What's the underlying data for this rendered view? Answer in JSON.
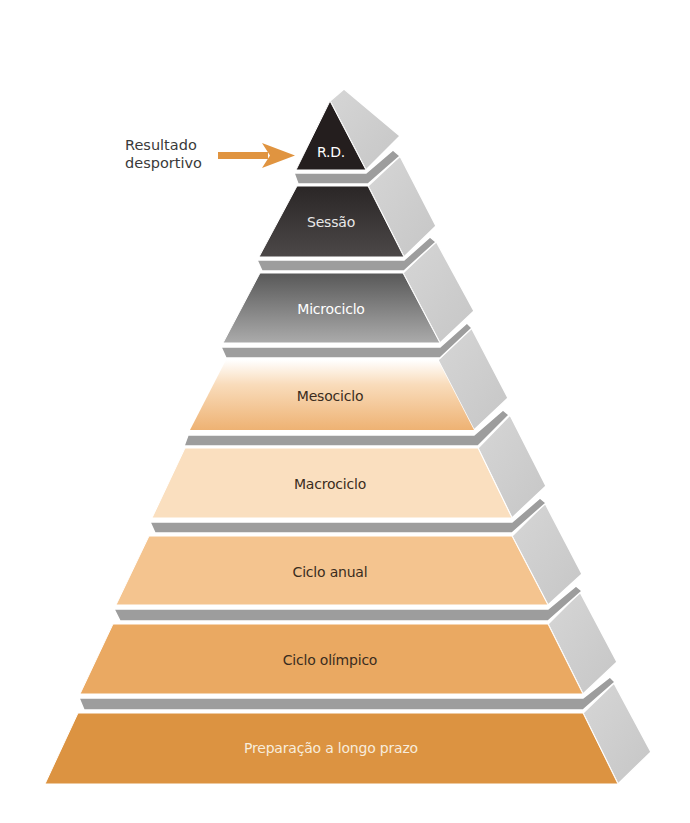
{
  "diagram": {
    "type": "pyramid",
    "callout": {
      "line1": "Resultado",
      "line2": "desportivo",
      "arrow_color": "#e09440",
      "points_to": "R.D."
    },
    "tiers": [
      {
        "label": "R.D.",
        "text_color": "#ffffff"
      },
      {
        "label": "Sessão",
        "text_color": "#e8e8e8"
      },
      {
        "label": "Microciclo",
        "text_color": "#ffffff"
      },
      {
        "label": "Mesociclo",
        "text_color": "#3a2c20"
      },
      {
        "label": "Macrociclo",
        "text_color": "#3a2c20"
      },
      {
        "label": "Ciclo anual",
        "text_color": "#3a2c20"
      },
      {
        "label": "Ciclo olímpico",
        "text_color": "#3a2c20"
      },
      {
        "label": "Preparação a longo prazo",
        "text_color": "#f7ecdc"
      }
    ],
    "colors": {
      "side_face": "#cfcfcf",
      "ledge": "#9c9c9c",
      "rd": "#241e1e",
      "sessao_top": "#2e2a2a",
      "sessao_bottom": "#4a4646",
      "micro_top": "#5a5a5a",
      "micro_bottom": "#a9a9a9",
      "meso_top": "#ffffff",
      "meso_bottom": "#f0b77a",
      "macro": "#fadfbf",
      "anual": "#f4c48f",
      "olimpico": "#eaa962",
      "longo_prazo": "#dc9341"
    }
  }
}
